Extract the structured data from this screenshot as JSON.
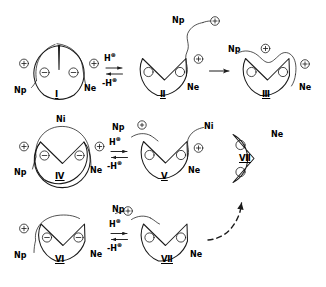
{
  "figure": {
    "type": "reaction-scheme",
    "title": "",
    "style": "hand-drawn chemical structures",
    "rows": 3,
    "line_color": "#1a1a1a",
    "background_color": "#ffffff"
  },
  "glyphs": {
    "plus_charge": "⊕",
    "minus_charge": "⊖",
    "plus_sign": "+",
    "minus_sign": "−",
    "arrow_right": "→",
    "equilibrium": "⇌"
  },
  "reagents": {
    "protonation": "H",
    "protonation_charge": "⊕",
    "deprotonation_prefix": "-",
    "deprotonation": "H",
    "deprotonation_charge": "⊕"
  },
  "groups": {
    "np": "Np",
    "ne": "Ne",
    "ni": "Ni"
  },
  "structures": [
    {
      "id": "structure-1",
      "label": "Ⅰ",
      "row": 1,
      "notch": "narrow-v",
      "inner_charges": [
        "⊖",
        "⊖"
      ],
      "outer_charges": [
        "⊕",
        "⊕"
      ],
      "tether_labels": [
        "Np",
        "Ne"
      ],
      "arc_label": ""
    },
    {
      "id": "structure-2",
      "label": "Ⅱ",
      "row": 1,
      "notch": "wide-v",
      "inner_charges": [],
      "outer_charges": [
        "⊕"
      ],
      "tether_labels": [
        "Ne"
      ],
      "pendant_label": "Np",
      "pendant_charge": "⊕"
    },
    {
      "id": "structure-3",
      "label": "Ⅲ",
      "row": 1,
      "notch": "wide-v",
      "inner_charges": [],
      "outer_charges": [
        "⊕"
      ],
      "tether_labels": [
        "Np",
        "Ne"
      ],
      "threaded_charge": "⊕"
    },
    {
      "id": "structure-4",
      "label": "Ⅳ",
      "row": 2,
      "notch": "wide-v",
      "inner_charges": [
        "⊖",
        "⊖"
      ],
      "outer_charges": [
        "⊕",
        "⊕"
      ],
      "tether_labels": [
        "Np",
        "Ne"
      ],
      "arc_label": "Ni"
    },
    {
      "id": "structure-5",
      "label": "Ⅴ",
      "row": 2,
      "notch": "wide-v",
      "inner_charges": [],
      "outer_charges": [
        "⊕"
      ],
      "tether_labels": [
        "Ne"
      ],
      "pendant_label": "Np",
      "pendant_charge": "⊕",
      "arc_label": "Ni"
    },
    {
      "id": "structure-7-product",
      "label": "Ⅶ",
      "row": 2,
      "notch": "pacman-wedge",
      "inner_charges": [],
      "outer_charges": [],
      "tether_labels": [
        "Ne"
      ]
    },
    {
      "id": "structure-6",
      "label": "Ⅵ",
      "row": 3,
      "notch": "wide-v",
      "inner_charges": [
        "⊖",
        "⊖"
      ],
      "outer_charges": [
        "⊕"
      ],
      "tether_labels": [
        "Np",
        "Ne"
      ]
    },
    {
      "id": "structure-7",
      "label": "Ⅶ",
      "row": 3,
      "notch": "wide-v",
      "inner_charges": [],
      "outer_charges": [],
      "tether_labels": [
        "Ne"
      ],
      "pendant_label": "Np",
      "pendant_charge": "⊕"
    }
  ],
  "arrows": [
    {
      "id": "eq-row1",
      "kind": "equilibrium",
      "top_label": "H",
      "top_charge": "⊕",
      "bottom_label": "-H",
      "bottom_charge": "⊕"
    },
    {
      "id": "arrow-row1-forward",
      "kind": "single-right",
      "top_label": "",
      "bottom_label": ""
    },
    {
      "id": "eq-row2",
      "kind": "equilibrium",
      "top_label": "H",
      "top_charge": "⊕",
      "bottom_label": "-H",
      "bottom_charge": "⊕"
    },
    {
      "id": "eq-row3",
      "kind": "equilibrium",
      "top_label": "H",
      "top_charge": "⊕",
      "bottom_label": "-H",
      "bottom_charge": "⊕"
    },
    {
      "id": "arrow-dashed-up",
      "kind": "dashed-curved-up",
      "top_label": "",
      "bottom_label": ""
    }
  ]
}
